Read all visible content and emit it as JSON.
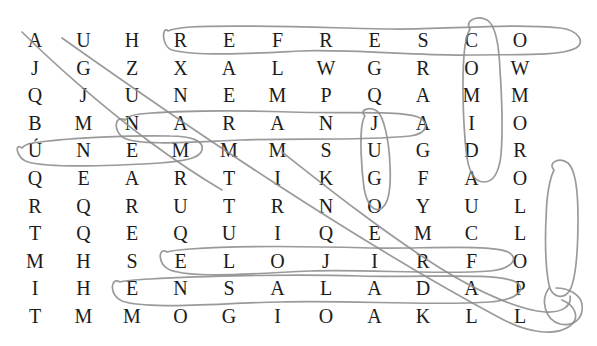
{
  "puzzle": {
    "type": "word-search",
    "title": "Sopa de letras",
    "rows": 11,
    "cols": 11,
    "cell_width": 48.5,
    "cell_height": 27.6,
    "origin_x": 18,
    "origin_y": 26,
    "grid": [
      [
        "A",
        "U",
        "H",
        "R",
        "E",
        "F",
        "R",
        "E",
        "S",
        "C",
        "O"
      ],
      [
        "J",
        "G",
        "Z",
        "X",
        "A",
        "L",
        "W",
        "G",
        "R",
        "O",
        "W"
      ],
      [
        "Q",
        "J",
        "U",
        "N",
        "E",
        "M",
        "P",
        "Q",
        "A",
        "M",
        "M"
      ],
      [
        "B",
        "M",
        "N",
        "A",
        "R",
        "A",
        "N",
        "J",
        "A",
        "I",
        "O"
      ],
      [
        "Ú",
        "N",
        "E",
        "M",
        "M",
        "M",
        "S",
        "U",
        "G",
        "D",
        "R"
      ],
      [
        "Q",
        "E",
        "A",
        "R",
        "T",
        "I",
        "K",
        "G",
        "F",
        "A",
        "O"
      ],
      [
        "R",
        "Q",
        "R",
        "U",
        "T",
        "R",
        "N",
        "O",
        "Y",
        "U",
        "L"
      ],
      [
        "T",
        "Q",
        "E",
        "Q",
        "U",
        "I",
        "Q",
        "E",
        "M",
        "C",
        "L"
      ],
      [
        "M",
        "H",
        "S",
        "E",
        "L",
        "O",
        "J",
        "I",
        "R",
        "F",
        "O"
      ],
      [
        "I",
        "H",
        "E",
        "N",
        "S",
        "A",
        "L",
        "A",
        "D",
        "A",
        "P"
      ],
      [
        "T",
        "M",
        "M",
        "O",
        "G",
        "I",
        "O",
        "A",
        "K",
        "L",
        "L"
      ]
    ],
    "found_words": [
      {
        "word": "REFRESCO",
        "shape": "horizontal-oval",
        "row": 1,
        "col_start": 4,
        "col_end": 11
      },
      {
        "word": "COMIDA",
        "shape": "vertical-oval",
        "col": 10,
        "row_start": 1,
        "row_end": 6
      },
      {
        "word": "NARANJA",
        "shape": "horizontal-oval",
        "row": 4,
        "col_start": 3,
        "col_end": 9
      },
      {
        "word": "JUGO",
        "shape": "vertical-oval",
        "col": 8,
        "row_start": 4,
        "row_end": 7
      },
      {
        "word": "ÚNEM",
        "shape": "horizontal-oval",
        "row": 5,
        "col_start": 1,
        "col_end": 4
      },
      {
        "word": "POLLO",
        "shape": "vertical-oval",
        "col": 11,
        "row_start": 6,
        "row_end": 10
      },
      {
        "word": "ELOJIRE",
        "shape": "horizontal-oval",
        "row": 9,
        "col_start": 4,
        "col_end": 10
      },
      {
        "word": "ENSALADA",
        "shape": "horizontal-oval",
        "row": 10,
        "col_start": 3,
        "col_end": 10
      },
      {
        "word": "diagonal-stroke-1",
        "shape": "diagonal-line",
        "from": "r1c1",
        "to": "r6c6"
      },
      {
        "word": "diagonal-stroke-2",
        "shape": "diagonal-line",
        "from": "r1c2",
        "to": "r11c11"
      },
      {
        "word": "diagonal-stroke-3",
        "shape": "diagonal-line",
        "from": "r5c1",
        "to": "r11c11"
      }
    ],
    "ink_color": "#8c8c8c",
    "letter_color": "#1c1c1c",
    "background_color": "#ffffff"
  }
}
